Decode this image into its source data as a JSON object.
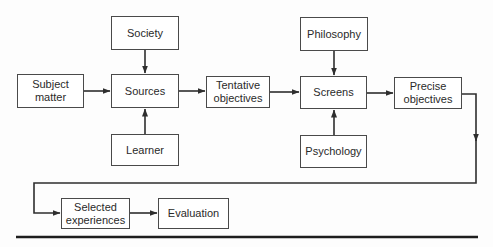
{
  "diagram": {
    "type": "flowchart",
    "colors": {
      "line": "#2e2e2e",
      "box_border": "#4a4a4a",
      "text": "#2a2a2a",
      "background": "#fdfdfd"
    },
    "nodes": {
      "subject_matter": {
        "label": "Subject\nmatter"
      },
      "society": {
        "label": "Society"
      },
      "sources": {
        "label": "Sources"
      },
      "learner": {
        "label": "Learner"
      },
      "tentative_objectives": {
        "label": "Tentative\nobjectives"
      },
      "philosophy": {
        "label": "Philosophy"
      },
      "screens": {
        "label": "Screens"
      },
      "psychology": {
        "label": "Psychology"
      },
      "precise_objectives": {
        "label": "Precise\nobjectives"
      },
      "selected_experiences": {
        "label": "Selected\nexperiences"
      },
      "evaluation": {
        "label": "Evaluation"
      }
    },
    "edges": [
      {
        "from": "subject_matter",
        "to": "sources"
      },
      {
        "from": "society",
        "to": "sources"
      },
      {
        "from": "learner",
        "to": "sources"
      },
      {
        "from": "sources",
        "to": "tentative_objectives"
      },
      {
        "from": "tentative_objectives",
        "to": "screens"
      },
      {
        "from": "philosophy",
        "to": "screens"
      },
      {
        "from": "psychology",
        "to": "screens"
      },
      {
        "from": "screens",
        "to": "precise_objectives"
      },
      {
        "from": "precise_objectives",
        "to": "selected_experiences"
      },
      {
        "from": "selected_experiences",
        "to": "evaluation"
      }
    ]
  }
}
